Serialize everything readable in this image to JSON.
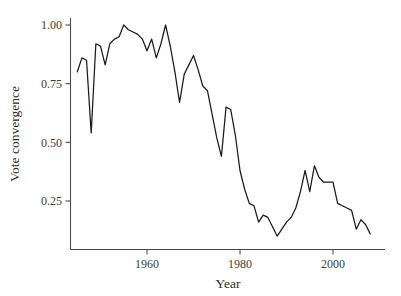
{
  "chart_data": {
    "type": "line",
    "title": "",
    "xlabel": "Year",
    "ylabel": "Vote convergence",
    "xlim": [
      1944,
      2009
    ],
    "ylim": [
      0.08,
      1.02
    ],
    "grid": false,
    "legend": null,
    "xticks": [
      1960,
      1980,
      2000
    ],
    "xtick_labels": [
      "1960",
      "1980",
      "2000"
    ],
    "yticks": [
      0.25,
      0.5,
      0.75,
      1.0
    ],
    "ytick_labels": [
      "0.25",
      "0.50",
      "0.75",
      "1.00"
    ],
    "line_color": "#1a1a1a",
    "series": [
      {
        "name": "Vote convergence",
        "x": [
          1945,
          1946,
          1947,
          1948,
          1949,
          1950,
          1951,
          1952,
          1953,
          1954,
          1955,
          1956,
          1957,
          1958,
          1959,
          1960,
          1961,
          1962,
          1963,
          1964,
          1965,
          1966,
          1967,
          1968,
          1969,
          1970,
          1971,
          1972,
          1973,
          1974,
          1975,
          1976,
          1977,
          1978,
          1979,
          1980,
          1981,
          1982,
          1983,
          1984,
          1985,
          1986,
          1987,
          1988,
          1989,
          1990,
          1991,
          1992,
          1993,
          1994,
          1995,
          1996,
          1997,
          1998,
          1999,
          2000,
          2001,
          2002,
          2003,
          2004,
          2005,
          2006,
          2007,
          2008
        ],
        "values": [
          0.8,
          0.86,
          0.85,
          0.54,
          0.92,
          0.91,
          0.83,
          0.92,
          0.94,
          0.95,
          1.0,
          0.98,
          0.97,
          0.96,
          0.94,
          0.89,
          0.94,
          0.86,
          0.92,
          1.0,
          0.91,
          0.8,
          0.67,
          0.79,
          0.83,
          0.87,
          0.81,
          0.74,
          0.72,
          0.62,
          0.52,
          0.44,
          0.65,
          0.64,
          0.53,
          0.38,
          0.3,
          0.24,
          0.23,
          0.16,
          0.19,
          0.18,
          0.14,
          0.1,
          0.13,
          0.16,
          0.18,
          0.22,
          0.29,
          0.38,
          0.29,
          0.4,
          0.35,
          0.33,
          0.33,
          0.33,
          0.24,
          0.23,
          0.22,
          0.21,
          0.13,
          0.17,
          0.15,
          0.11
        ]
      }
    ]
  },
  "axes": {
    "x_title": "Year",
    "y_title": "Vote convergence"
  }
}
